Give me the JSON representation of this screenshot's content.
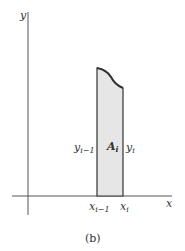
{
  "diagram": {
    "axes": {
      "x_label": "x",
      "y_label": "y"
    },
    "strip": {
      "area_label": "A",
      "area_sub": "i",
      "left_height_label": "y",
      "left_height_sub": "i−1",
      "right_height_label": "y",
      "right_height_sub": "i",
      "left_x_label": "x",
      "left_x_sub": "i−1",
      "right_x_label": "x",
      "right_x_sub": "i",
      "fill_color": "#e6e6e6",
      "stroke_color": "#333333"
    },
    "caption": "(b)"
  }
}
